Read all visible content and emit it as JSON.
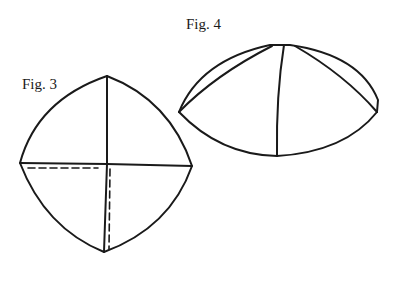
{
  "figures": [
    {
      "id": "fig3",
      "label": "Fig. 3",
      "description": "Four-gore curved panel pattern viewed flat, with quadrant divisions and dashed seam allowance lines in lower-left quadrant"
    },
    {
      "id": "fig4",
      "label": "Fig. 4",
      "description": "Assembled dome cap viewed from side showing curved gore seams"
    }
  ],
  "colors": {
    "stroke": "#1a1a1a",
    "background": "#ffffff"
  }
}
